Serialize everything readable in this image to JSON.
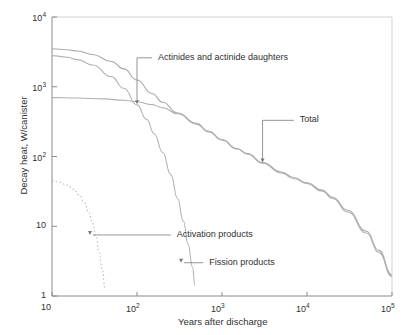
{
  "chart_data": {
    "type": "line",
    "title": "",
    "xlabel": "Years after discharge",
    "ylabel": "Decay heat, W/canister",
    "xscale": "log",
    "yscale": "log",
    "xlim": [
      10,
      100000
    ],
    "ylim": [
      1,
      10000
    ],
    "grid": false,
    "legend_position": "inline-annotations",
    "xticks": [
      {
        "value": 10,
        "label": "10",
        "mantissa": "10",
        "exponent": ""
      },
      {
        "value": 100,
        "label": "10^2",
        "mantissa": "10",
        "exponent": "2"
      },
      {
        "value": 1000,
        "label": "10^3",
        "mantissa": "10",
        "exponent": "3"
      },
      {
        "value": 10000,
        "label": "10^4",
        "mantissa": "10",
        "exponent": "4"
      },
      {
        "value": 100000,
        "label": "10^5",
        "mantissa": "10",
        "exponent": "5"
      }
    ],
    "yticks": [
      {
        "value": 1,
        "label": "1",
        "mantissa": "1",
        "exponent": ""
      },
      {
        "value": 10,
        "label": "10",
        "mantissa": "10",
        "exponent": ""
      },
      {
        "value": 100,
        "label": "10^2",
        "mantissa": "10",
        "exponent": "2"
      },
      {
        "value": 1000,
        "label": "10^3",
        "mantissa": "10",
        "exponent": "3"
      },
      {
        "value": 10000,
        "label": "10^4",
        "mantissa": "10",
        "exponent": "4"
      }
    ],
    "series": [
      {
        "name": "Total",
        "style": "solid",
        "color": "#aaaaaa",
        "points": [
          [
            10,
            3500
          ],
          [
            15,
            3400
          ],
          [
            20,
            3250
          ],
          [
            30,
            2900
          ],
          [
            50,
            2300
          ],
          [
            70,
            1800
          ],
          [
            100,
            1250
          ],
          [
            150,
            800
          ],
          [
            200,
            600
          ],
          [
            300,
            420
          ],
          [
            500,
            300
          ],
          [
            700,
            230
          ],
          [
            1000,
            175
          ],
          [
            1500,
            130
          ],
          [
            2000,
            110
          ],
          [
            3000,
            82
          ],
          [
            5000,
            60
          ],
          [
            7000,
            50
          ],
          [
            10000,
            42
          ],
          [
            15000,
            33
          ],
          [
            20000,
            26
          ],
          [
            30000,
            17
          ],
          [
            50000,
            8.5
          ],
          [
            70000,
            4.5
          ],
          [
            100000,
            2
          ]
        ]
      },
      {
        "name": "Fission products",
        "style": "solid",
        "color": "#b4b4b4",
        "points": [
          [
            10,
            2800
          ],
          [
            15,
            2650
          ],
          [
            20,
            2450
          ],
          [
            30,
            2050
          ],
          [
            50,
            1400
          ],
          [
            70,
            950
          ],
          [
            100,
            550
          ],
          [
            130,
            340
          ],
          [
            160,
            210
          ],
          [
            200,
            115
          ],
          [
            250,
            55
          ],
          [
            300,
            25
          ],
          [
            350,
            12
          ],
          [
            400,
            5.5
          ],
          [
            450,
            2.6
          ],
          [
            480,
            1.4
          ]
        ]
      },
      {
        "name": "Actinides and actinide daughters",
        "style": "solid",
        "color": "#b0b0b0",
        "points": [
          [
            10,
            700
          ],
          [
            20,
            690
          ],
          [
            40,
            670
          ],
          [
            70,
            640
          ],
          [
            100,
            610
          ],
          [
            150,
            555
          ],
          [
            200,
            500
          ],
          [
            300,
            410
          ],
          [
            500,
            290
          ],
          [
            700,
            225
          ],
          [
            1000,
            172
          ],
          [
            1500,
            128
          ],
          [
            2000,
            108
          ],
          [
            3000,
            80
          ],
          [
            5000,
            58
          ],
          [
            7000,
            48
          ],
          [
            10000,
            41
          ],
          [
            15000,
            32
          ],
          [
            20000,
            25
          ],
          [
            30000,
            16
          ],
          [
            50000,
            8
          ],
          [
            70000,
            4.2
          ],
          [
            100000,
            1.9
          ]
        ]
      },
      {
        "name": "Activation products",
        "style": "dashed",
        "color": "#c0c0c0",
        "points": [
          [
            10,
            45
          ],
          [
            12,
            43
          ],
          [
            15,
            39
          ],
          [
            18,
            34
          ],
          [
            21,
            28
          ],
          [
            24,
            22
          ],
          [
            27,
            16
          ],
          [
            30,
            11
          ],
          [
            33,
            7
          ],
          [
            36,
            4.2
          ],
          [
            39,
            2.4
          ],
          [
            42,
            1.3
          ]
        ]
      }
    ],
    "annotations": [
      {
        "name": "actinides-annotation",
        "text": "Actinides and actinide daughters",
        "target": [
          100,
          560
        ],
        "label_anchor": [
          150,
          2600
        ]
      },
      {
        "name": "total-annotation",
        "text": "Total",
        "target": [
          3000,
          82
        ],
        "label_anchor": [
          7000,
          330
        ]
      },
      {
        "name": "activation-products-annotation",
        "text": "Activation products",
        "target": [
          28,
          7.5
        ],
        "label_anchor": [
          250,
          7.5
        ]
      },
      {
        "name": "fission-products-annotation",
        "text": "Fission products",
        "target": [
          330,
          3.0
        ],
        "label_anchor": [
          600,
          3.0
        ]
      }
    ]
  }
}
